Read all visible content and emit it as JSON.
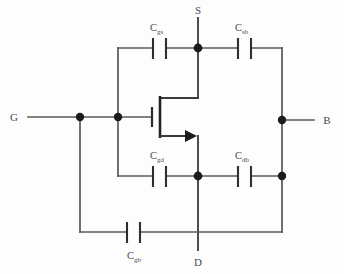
{
  "diagram": {
    "background_color": "#fdfdfd",
    "wire_color": "#58585a",
    "node_color": "#1b1b1c",
    "label_color": "#4a4a4c"
  },
  "terminals": [
    {
      "id": "gate",
      "label": "G",
      "position": "left"
    },
    {
      "id": "source",
      "label": "S",
      "position": "top"
    },
    {
      "id": "drain",
      "label": "D",
      "position": "bottom"
    },
    {
      "id": "bulk",
      "label": "B",
      "position": "right"
    }
  ],
  "capacitors": [
    {
      "id": "cgs",
      "base": "C",
      "sub": "gs",
      "between": "gate-source",
      "position": "top-left"
    },
    {
      "id": "csb",
      "base": "C",
      "sub": "sb",
      "between": "source-bulk",
      "position": "top-right"
    },
    {
      "id": "cgd",
      "base": "C",
      "sub": "gd",
      "between": "gate-drain",
      "position": "mid-left"
    },
    {
      "id": "cdb",
      "base": "C",
      "sub": "db",
      "between": "drain-bulk",
      "position": "mid-right"
    },
    {
      "id": "cgb",
      "base": "C",
      "sub": "gb",
      "between": "gate-bulk",
      "position": "bottom"
    }
  ],
  "device": {
    "type": "mosfet",
    "symbol": "n-channel MOSFET",
    "arrow_direction": "right"
  },
  "nodes": [
    {
      "id": "gate-node-outer",
      "x": 80,
      "y": 117
    },
    {
      "id": "gate-node-inner",
      "x": 118,
      "y": 117
    },
    {
      "id": "source-node",
      "x": 198,
      "y": 48
    },
    {
      "id": "drain-node",
      "x": 198,
      "y": 176
    },
    {
      "id": "bulk-node-upper",
      "x": 282,
      "y": 120
    },
    {
      "id": "bulk-node-lower",
      "x": 282,
      "y": 176
    }
  ]
}
